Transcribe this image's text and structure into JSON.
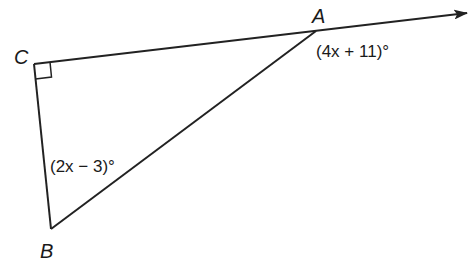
{
  "diagram": {
    "type": "geometry-triangle",
    "vertices": {
      "A": {
        "label": "A",
        "x": 316,
        "y": 31
      },
      "B": {
        "label": "B",
        "x": 51,
        "y": 229
      },
      "C": {
        "label": "C",
        "x": 34,
        "y": 64
      }
    },
    "right_angle_at": "C",
    "ray": {
      "from": "C",
      "through": "A",
      "arrow": true
    },
    "angle_labels": {
      "exterior_A": "(4x + 11)°",
      "interior_B": "(2x − 3)°"
    },
    "colors": {
      "line": "#222222",
      "text": "#1a1a1a",
      "background": "#ffffff"
    }
  }
}
